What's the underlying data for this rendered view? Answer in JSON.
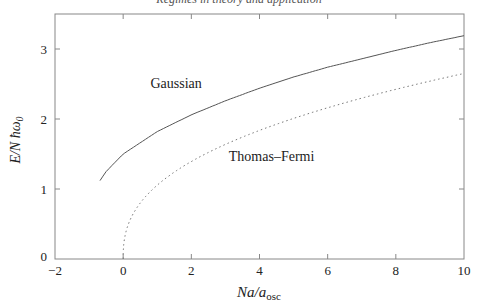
{
  "header": "Regimes in theory and application",
  "chart_data": {
    "type": "line",
    "title": "",
    "xlabel": "Na/a_osc",
    "ylabel": "E/N ħω0",
    "xlim": [
      -2,
      10
    ],
    "ylim": [
      0,
      3.5
    ],
    "xticks": [
      -2,
      0,
      2,
      4,
      6,
      8,
      10
    ],
    "yticks": [
      0,
      1,
      2,
      3
    ],
    "grid": false,
    "legend": "inline annotations",
    "series": [
      {
        "name": "Gaussian",
        "style": "solid",
        "x": [
          -0.68,
          -0.5,
          0,
          1,
          2,
          3,
          4,
          5,
          6,
          7,
          8,
          9,
          10
        ],
        "y": [
          1.12,
          1.25,
          1.5,
          1.82,
          2.06,
          2.26,
          2.44,
          2.6,
          2.74,
          2.86,
          2.98,
          3.09,
          3.19
        ]
      },
      {
        "name": "Thomas–Fermi",
        "style": "dotted",
        "x": [
          0,
          0.1,
          0.25,
          0.5,
          1,
          2,
          3,
          4,
          5,
          6,
          7,
          8,
          9,
          10
        ],
        "y": [
          0,
          0.59,
          0.8,
          1.06,
          1.05,
          1.38,
          1.62,
          1.82,
          1.99,
          2.14,
          2.27,
          2.4,
          2.52,
          2.65
        ]
      }
    ],
    "annotations": [
      {
        "text": "Gaussian",
        "x": 0.8,
        "y": 2.45
      },
      {
        "text": "Thomas–Fermi",
        "x": 3.1,
        "y": 1.4
      }
    ]
  }
}
